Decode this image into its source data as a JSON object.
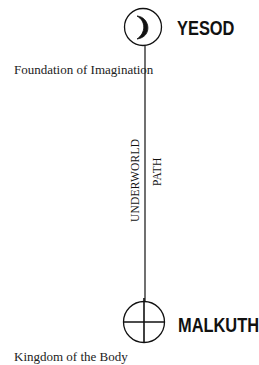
{
  "diagram": {
    "top_node": {
      "name": "YESOD",
      "symbol": "crescent-moon",
      "caption": "Foundation of Imagination"
    },
    "bottom_node": {
      "name": "MALKUTH",
      "symbol": "circled-cross",
      "caption": "Kingdom of the Body"
    },
    "path": {
      "label_line1": "UNDERWORLD",
      "label_line2": "PATH"
    },
    "colors": {
      "stroke": "#111111",
      "background": "#ffffff"
    }
  }
}
